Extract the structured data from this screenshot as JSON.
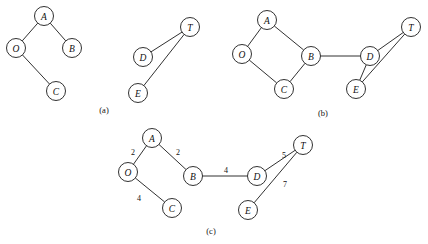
{
  "figure": {
    "background_color": "#ffffff",
    "line_color": "#1a1a1a",
    "node_fill": "#ffffff",
    "node_radius": 9.5,
    "captions": [
      {
        "id": "caption-a",
        "label": "(a)",
        "x": 104,
        "y": 110
      },
      {
        "id": "caption-b",
        "label": "(b)",
        "x": 323,
        "y": 113
      },
      {
        "id": "caption-c",
        "label": "(c)",
        "x": 211,
        "y": 231
      }
    ]
  },
  "panels": [
    {
      "id": "panel-a",
      "caption": "(a)",
      "description": "Two disconnected components: tree A-O-B-C and component D-T-E",
      "weighted": false,
      "nodes": [
        {
          "id": "a-A",
          "label": "A",
          "x": 44,
          "y": 16
        },
        {
          "id": "a-O",
          "label": "O",
          "x": 16,
          "y": 48
        },
        {
          "id": "a-B",
          "label": "B",
          "x": 72,
          "y": 48
        },
        {
          "id": "a-C",
          "label": "C",
          "x": 56,
          "y": 91
        },
        {
          "id": "a-D",
          "label": "D",
          "x": 143,
          "y": 57
        },
        {
          "id": "a-T",
          "label": "T",
          "x": 190,
          "y": 27
        },
        {
          "id": "a-E",
          "label": "E",
          "x": 138,
          "y": 93
        }
      ],
      "edges": [
        {
          "from": "a-A",
          "to": "a-O",
          "weight": null
        },
        {
          "from": "a-A",
          "to": "a-B",
          "weight": null
        },
        {
          "from": "a-O",
          "to": "a-C",
          "weight": null
        },
        {
          "from": "a-D",
          "to": "a-T",
          "weight": null
        },
        {
          "from": "a-E",
          "to": "a-T",
          "weight": null
        }
      ]
    },
    {
      "id": "panel-b",
      "caption": "(b)",
      "description": "Connected graph with cycle A-O-C-B and cycle D-E-T joined by bridge B-D",
      "weighted": false,
      "nodes": [
        {
          "id": "b-A",
          "label": "A",
          "x": 267,
          "y": 20
        },
        {
          "id": "b-O",
          "label": "O",
          "x": 242,
          "y": 54
        },
        {
          "id": "b-B",
          "label": "B",
          "x": 311,
          "y": 56
        },
        {
          "id": "b-C",
          "label": "C",
          "x": 284,
          "y": 89
        },
        {
          "id": "b-D",
          "label": "D",
          "x": 370,
          "y": 56
        },
        {
          "id": "b-T",
          "label": "T",
          "x": 411,
          "y": 27
        },
        {
          "id": "b-E",
          "label": "E",
          "x": 356,
          "y": 89
        }
      ],
      "edges": [
        {
          "from": "b-A",
          "to": "b-O",
          "weight": null
        },
        {
          "from": "b-A",
          "to": "b-B",
          "weight": null
        },
        {
          "from": "b-O",
          "to": "b-C",
          "weight": null
        },
        {
          "from": "b-C",
          "to": "b-B",
          "weight": null
        },
        {
          "from": "b-B",
          "to": "b-D",
          "weight": null
        },
        {
          "from": "b-D",
          "to": "b-T",
          "weight": null
        },
        {
          "from": "b-D",
          "to": "b-E",
          "weight": null
        },
        {
          "from": "b-E",
          "to": "b-T",
          "weight": null
        }
      ]
    },
    {
      "id": "panel-c",
      "caption": "(c)",
      "description": "Spanning tree with edge weights",
      "weighted": true,
      "nodes": [
        {
          "id": "c-A",
          "label": "A",
          "x": 152,
          "y": 138
        },
        {
          "id": "c-O",
          "label": "O",
          "x": 128,
          "y": 172
        },
        {
          "id": "c-B",
          "label": "B",
          "x": 193,
          "y": 176
        },
        {
          "id": "c-C",
          "label": "C",
          "x": 172,
          "y": 208
        },
        {
          "id": "c-D",
          "label": "D",
          "x": 257,
          "y": 176
        },
        {
          "id": "c-T",
          "label": "T",
          "x": 303,
          "y": 145
        },
        {
          "id": "c-E",
          "label": "E",
          "x": 248,
          "y": 210
        }
      ],
      "edges": [
        {
          "from": "c-O",
          "to": "c-A",
          "weight": "2",
          "wx": 133,
          "wy": 152
        },
        {
          "from": "c-A",
          "to": "c-B",
          "weight": "2",
          "wx": 178,
          "wy": 152
        },
        {
          "from": "c-O",
          "to": "c-C",
          "weight": "4",
          "wx": 139,
          "wy": 198
        },
        {
          "from": "c-B",
          "to": "c-D",
          "weight": "4",
          "wx": 226,
          "wy": 170
        },
        {
          "from": "c-D",
          "to": "c-T",
          "weight": "5",
          "wx": 284,
          "wy": 155
        },
        {
          "from": "c-E",
          "to": "c-T",
          "weight": "7",
          "wx": 285,
          "wy": 184
        }
      ]
    }
  ]
}
